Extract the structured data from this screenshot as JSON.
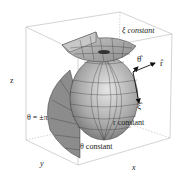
{
  "diagram": {
    "type": "3d-coordinate-surfaces",
    "labels": {
      "xi_constant": "ξ constant",
      "r_constant": "r constant",
      "theta_constant": "θ constant",
      "theta_pm_pi": "θ = ±π"
    },
    "axes": {
      "x": "x",
      "y": "y",
      "z": "z"
    },
    "unit_vectors": {
      "theta_hat": "θ̂",
      "r_hat": "r̂",
      "xi_hat": "ξ̂"
    },
    "colors": {
      "surface": "#9a9a9a",
      "surface_light": "#d4d4d4",
      "grid": "#3a3a3a",
      "box": "#b0b0b0",
      "arrow": "#111111"
    }
  }
}
